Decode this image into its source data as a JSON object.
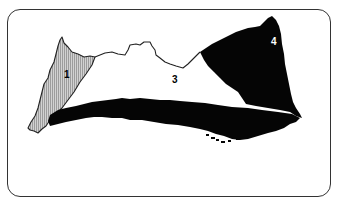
{
  "map": {
    "title": "",
    "regions": [
      {
        "id": 1,
        "label": "1",
        "fill": "hatched-grey",
        "color": "#b8b8b8"
      },
      {
        "id": 2,
        "label": "",
        "fill": "solid-black",
        "color": "#000000"
      },
      {
        "id": 3,
        "label": "3",
        "fill": "white",
        "color": "#ffffff"
      },
      {
        "id": 4,
        "label": "4",
        "fill": "solid-black",
        "color": "#000000"
      }
    ],
    "colors": {
      "frame_border": "#333333",
      "outline": "#222222",
      "hatch_light": "#d0d0d0",
      "hatch_dark": "#9a9a9a",
      "dark_region": "#050505",
      "label_on_dark": "#ffffff",
      "label_on_light": "#000000"
    }
  }
}
